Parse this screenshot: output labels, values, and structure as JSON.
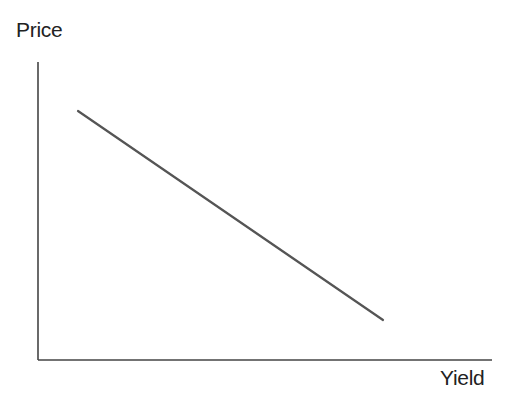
{
  "chart_data": {
    "type": "line",
    "title": "",
    "xlabel": "Yield",
    "ylabel": "Price",
    "grid": false,
    "legend": null,
    "ticks": {
      "x": [],
      "y": []
    },
    "series": [
      {
        "name": "Price-Yield relationship",
        "points": [
          {
            "x": 0.09,
            "y": 0.84
          },
          {
            "x": 0.76,
            "y": 0.13
          }
        ],
        "pixel_points": [
          [
            78,
            111
          ],
          [
            383,
            320
          ]
        ],
        "color": "#555555"
      }
    ],
    "axes_pixels": {
      "origin": [
        38,
        360
      ],
      "x_end": [
        492,
        360
      ],
      "y_top": [
        38,
        62
      ]
    }
  },
  "labels": {
    "y_axis": "Price",
    "x_axis": "Yield"
  }
}
